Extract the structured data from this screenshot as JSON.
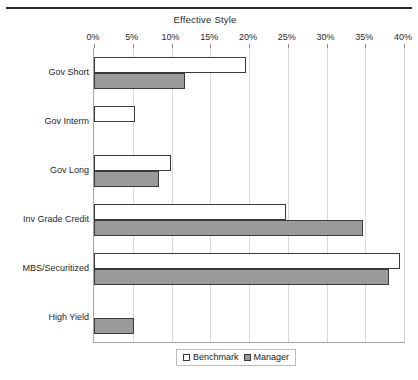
{
  "chart_data": {
    "type": "bar",
    "orientation": "horizontal",
    "title": "Effective Style",
    "xlabel": "",
    "ylabel": "",
    "xlim": [
      0,
      40
    ],
    "xtick_labels": [
      "0%",
      "5%",
      "10%",
      "15%",
      "20%",
      "25%",
      "30%",
      "35%",
      "40%"
    ],
    "xticks": [
      0,
      5,
      10,
      15,
      20,
      25,
      30,
      35,
      40
    ],
    "xunit": "%",
    "grid": true,
    "legend_position": "bottom-center",
    "categories": [
      "Gov Short",
      "Gov Interm",
      "Gov Long",
      "Inv Grade Credit",
      "MBS/Securitized",
      "High Yield"
    ],
    "series": [
      {
        "name": "Benchmark",
        "color": "#ffffff",
        "values": [
          19.6,
          5.3,
          9.9,
          24.8,
          39.5,
          0
        ]
      },
      {
        "name": "Manager",
        "color": "#9a9a9a",
        "values": [
          11.7,
          0,
          8.4,
          34.7,
          38.0,
          5.2
        ]
      }
    ]
  },
  "legend": {
    "items": [
      {
        "label": "Benchmark",
        "swatch": "benchmark"
      },
      {
        "label": "Manager",
        "swatch": "manager"
      }
    ]
  }
}
